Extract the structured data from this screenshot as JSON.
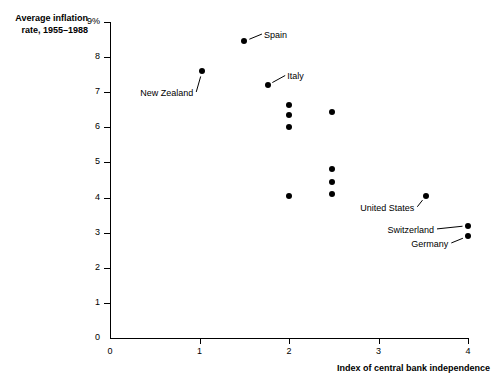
{
  "chart_data": {
    "type": "scatter",
    "title": "",
    "xlabel": "Index of central bank independence",
    "ylabel": "Average inflation rate, 1955–1988",
    "ylabel_lines": [
      "Average inflation",
      "rate, 1955–1988"
    ],
    "xlim": [
      0,
      4
    ],
    "ylim": [
      0,
      9
    ],
    "grid": false,
    "legend": false,
    "xticks": [
      "0",
      "1",
      "2",
      "3",
      "4"
    ],
    "xtick_values": [
      0,
      1,
      2,
      3,
      4
    ],
    "yticks": [
      "0",
      "1",
      "2",
      "3",
      "4",
      "5",
      "6",
      "7",
      "8",
      "9%"
    ],
    "ytick_values": [
      0,
      1,
      2,
      3,
      4,
      5,
      6,
      7,
      8,
      9
    ],
    "points": [
      {
        "x": 1.03,
        "y": 7.6,
        "label": "New Zealand"
      },
      {
        "x": 1.5,
        "y": 8.45,
        "label": "Spain"
      },
      {
        "x": 1.76,
        "y": 7.2,
        "label": "Italy"
      },
      {
        "x": 2.0,
        "y": 6.65,
        "label": ""
      },
      {
        "x": 2.0,
        "y": 6.35,
        "label": ""
      },
      {
        "x": 2.0,
        "y": 6.0,
        "label": ""
      },
      {
        "x": 2.0,
        "y": 4.05,
        "label": ""
      },
      {
        "x": 2.48,
        "y": 6.45,
        "label": ""
      },
      {
        "x": 2.48,
        "y": 4.8,
        "label": ""
      },
      {
        "x": 2.48,
        "y": 4.45,
        "label": ""
      },
      {
        "x": 2.48,
        "y": 4.1,
        "label": ""
      },
      {
        "x": 3.53,
        "y": 4.05,
        "label": "United States"
      },
      {
        "x": 4.0,
        "y": 3.2,
        "label": "Switzerland"
      },
      {
        "x": 4.0,
        "y": 2.9,
        "label": "Germany"
      }
    ],
    "annotations": [
      {
        "text": "Spain",
        "x": 1.72,
        "y": 8.6,
        "anchor": "left",
        "point_x": 1.5,
        "point_y": 8.45
      },
      {
        "text": "Italy",
        "x": 1.98,
        "y": 7.42,
        "anchor": "left",
        "point_x": 1.76,
        "point_y": 7.2
      },
      {
        "text": "New Zealand",
        "x": 0.93,
        "y": 6.95,
        "anchor": "right",
        "point_x": 1.03,
        "point_y": 7.6
      },
      {
        "text": "United States",
        "x": 3.4,
        "y": 3.68,
        "anchor": "right",
        "point_x": 3.53,
        "point_y": 4.05
      },
      {
        "text": "Switzerland",
        "x": 3.62,
        "y": 3.05,
        "anchor": "right",
        "point_x": 4.0,
        "point_y": 3.2
      },
      {
        "text": "Germany",
        "x": 3.78,
        "y": 2.65,
        "anchor": "right",
        "point_x": 4.0,
        "point_y": 2.9
      }
    ]
  }
}
